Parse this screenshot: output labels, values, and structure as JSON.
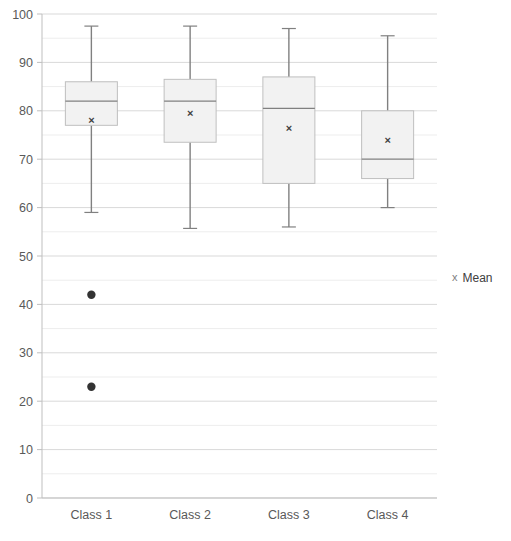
{
  "chart_data": {
    "type": "box",
    "title": "",
    "xlabel": "",
    "ylabel": "",
    "categories": [
      "Class 1",
      "Class 2",
      "Class 3",
      "Class 4"
    ],
    "ylim": [
      0,
      100
    ],
    "y_ticks": [
      0,
      10,
      20,
      30,
      40,
      50,
      60,
      70,
      80,
      90,
      100
    ],
    "y_tick_labels": [
      "0",
      "10",
      "20",
      "30",
      "40",
      "50",
      "60",
      "70",
      "80",
      "90",
      "100"
    ],
    "minor_gridline_step": 5,
    "grid": true,
    "legend": {
      "position": "right",
      "entries": [
        {
          "label": "Mean",
          "marker": "x",
          "color": "#808080"
        }
      ]
    },
    "boxes": [
      {
        "category": "Class 1",
        "whisker_low": 59,
        "q1": 77,
        "median": 82,
        "q3": 86,
        "whisker_high": 97.5,
        "mean": 78,
        "outliers": [
          42,
          23
        ]
      },
      {
        "category": "Class 2",
        "whisker_low": 55.7,
        "q1": 73.5,
        "median": 82,
        "q3": 86.5,
        "whisker_high": 97.5,
        "mean": 79.5,
        "outliers": []
      },
      {
        "category": "Class 3",
        "whisker_low": 56,
        "q1": 65,
        "median": 80.5,
        "q3": 87,
        "whisker_high": 97,
        "mean": 76.5,
        "outliers": []
      },
      {
        "category": "Class 4",
        "whisker_low": 60,
        "q1": 66,
        "median": 70,
        "q3": 80,
        "whisker_high": 95.5,
        "mean": 74,
        "outliers": []
      }
    ],
    "style": {
      "box_fill": "#f2f2f2",
      "box_stroke": "#bfbfbf",
      "whisker_color": "#808080",
      "median_color": "#808080",
      "mean_marker_color": "#404040",
      "outlier_color": "#333333",
      "gridline_major": "#d9d9d9",
      "gridline_minor": "#ededed",
      "axis_color": "#bfbfbf",
      "tick_label_color": "#595959"
    }
  }
}
